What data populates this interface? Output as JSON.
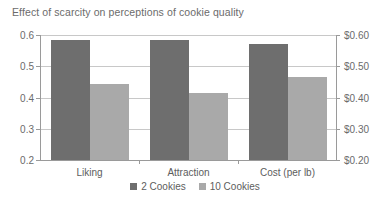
{
  "chart_data": {
    "type": "bar",
    "title": "Effect of scarcity on perceptions of cookie quality",
    "xlabel": "",
    "ylabel": "",
    "categories": [
      "Liking",
      "Attraction",
      "Cost (per lb)"
    ],
    "series": [
      {
        "name": "2 Cookies",
        "values": [
          0.583,
          0.585,
          0.57
        ],
        "color": "#6e6e6e"
      },
      {
        "name": "10 Cookies",
        "values": [
          0.443,
          0.415,
          0.465
        ],
        "color": "#a9a9a9"
      }
    ],
    "axes": {
      "left": {
        "ylim": [
          0.2,
          0.6
        ],
        "ticks": [
          0.2,
          0.3,
          0.4,
          0.5,
          0.6
        ],
        "tick_labels": [
          "0.2",
          "0.3",
          "0.4",
          "0.5",
          "0.6"
        ]
      },
      "right": {
        "ylim": [
          0.2,
          0.6
        ],
        "ticks": [
          0.2,
          0.3,
          0.4,
          0.5,
          0.6
        ],
        "tick_labels": [
          "$0.20",
          "$0.30",
          "$0.40",
          "$0.50",
          "$0.60"
        ]
      }
    },
    "grid": true,
    "legend_position": "bottom-center",
    "legend": [
      "2 Cookies",
      "10 Cookies"
    ],
    "background": "#ffffff"
  }
}
